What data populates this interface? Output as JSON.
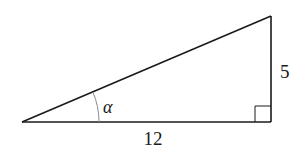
{
  "diagram": {
    "type": "right-triangle",
    "labels": {
      "base": "12",
      "height": "5",
      "angle": "α"
    },
    "colors": {
      "stroke": "#1a1a1a",
      "arc": "#8a8a8a",
      "background": "#ffffff"
    },
    "vertices": {
      "left": [
        22,
        122
      ],
      "right_angle": [
        271,
        122
      ],
      "top": [
        271,
        16
      ]
    }
  }
}
